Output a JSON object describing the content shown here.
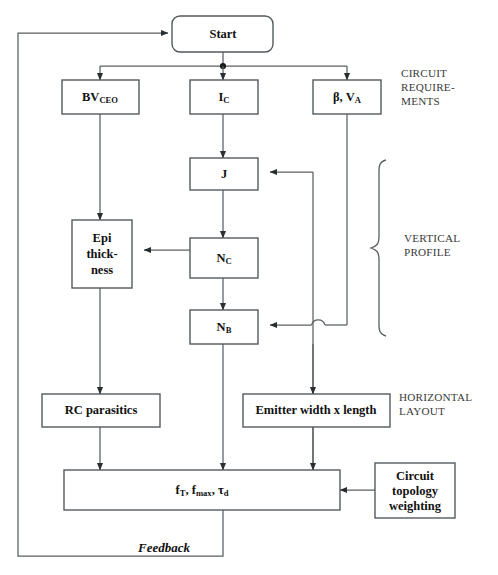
{
  "diagram": {
    "nodes": {
      "start": {
        "label": "Start"
      },
      "bvceo": {
        "label": "BV",
        "sub": "CEO"
      },
      "ic": {
        "label": "I",
        "sub": "C"
      },
      "beta_va": {
        "label": "β, V",
        "sub": "A"
      },
      "j": {
        "label": "J"
      },
      "epi": {
        "line1": "Epi",
        "line2": "thick-",
        "line3": "ness"
      },
      "nc": {
        "label": "N",
        "sub": "C"
      },
      "nb": {
        "label": "N",
        "sub": "B"
      },
      "rc": {
        "label": "RC parasitics"
      },
      "emitter": {
        "label": "Emitter width x length"
      },
      "figures": {
        "pre": "f",
        "sub1": "T",
        "mid": ", f",
        "sub2": "max",
        "post": ", τ",
        "sub3": "d"
      },
      "topology": {
        "line1": "Circuit",
        "line2": "topology",
        "line3": "weighting"
      }
    },
    "side_labels": {
      "circuit_requirements": [
        "CIRCUIT",
        "REQUIRE-",
        "MENTS"
      ],
      "vertical_profile": [
        "VERTICAL",
        "PROFILE"
      ],
      "horizontal_layout": [
        "HORIZONTAL",
        "LAYOUT"
      ]
    },
    "edge_labels": {
      "feedback": "Feedback"
    },
    "colors": {
      "background": "#ffffff",
      "box_stroke": "#555a5e",
      "wire": "#5a5f63",
      "text": "#111111",
      "side_text": "#3a3a3a"
    }
  }
}
